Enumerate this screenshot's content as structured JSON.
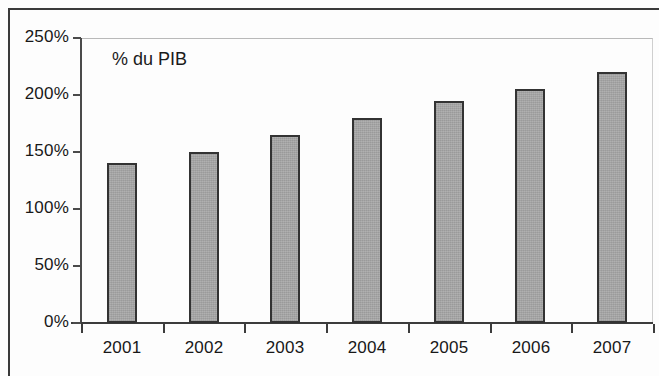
{
  "chart_data": {
    "type": "bar",
    "title": "",
    "subtitle": "",
    "annotation": "% du PIB",
    "xlabel": "",
    "ylabel": "",
    "categories": [
      "2001",
      "2002",
      "2003",
      "2004",
      "2005",
      "2006",
      "2007"
    ],
    "values": [
      140,
      150,
      165,
      180,
      195,
      205,
      220
    ],
    "value_unit": "%",
    "series": [
      {
        "name": "% du PIB",
        "values": [
          140,
          150,
          165,
          180,
          195,
          205,
          220
        ]
      }
    ],
    "ylim": [
      0,
      250
    ],
    "ytick_values": [
      0,
      50,
      100,
      150,
      200,
      250
    ],
    "ytick_labels": [
      "0%",
      "50%",
      "100%",
      "150%",
      "200%",
      "250%"
    ],
    "grid": false,
    "legend": false,
    "legend_position": "none",
    "bar_fill_color": "#a9a9a9",
    "bar_border_color": "#333333",
    "axis_color": "#3c3c3c",
    "text_color": "#181818",
    "background_color": "#ffffff"
  }
}
